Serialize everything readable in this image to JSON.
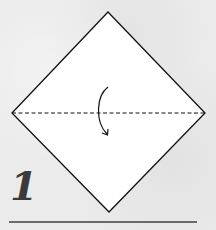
{
  "diagram": {
    "type": "origami-instruction",
    "step": {
      "number": "1"
    },
    "square": {
      "orientation": "diamond",
      "fill": "#ffffff",
      "stroke": "#111111",
      "vertices": {
        "top": [
          108,
          12
        ],
        "right": [
          205,
          113
        ],
        "bottom": [
          109,
          212
        ],
        "left": [
          12,
          113
        ]
      }
    },
    "fold_line": {
      "style": "valley-fold-dashed",
      "from": [
        12,
        113
      ],
      "to": [
        205,
        113
      ]
    },
    "arrow": {
      "meaning": "fold-top-down",
      "direction": "down"
    },
    "separator_color": "#6a6a6a",
    "background_color": "#ebebeb"
  }
}
